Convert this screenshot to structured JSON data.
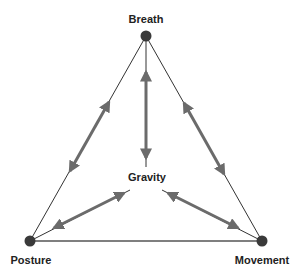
{
  "diagram": {
    "nodes": [
      {
        "id": "breath",
        "label": "Breath",
        "x": 146,
        "y": 36
      },
      {
        "id": "posture",
        "label": "Posture",
        "x": 30,
        "y": 241
      },
      {
        "id": "movement",
        "label": "Movement",
        "x": 262,
        "y": 241
      }
    ],
    "center": {
      "id": "gravity",
      "label": "Gravity",
      "x": 146,
      "y": 178
    },
    "edges": [
      {
        "from": "breath",
        "to": "posture",
        "type": "line"
      },
      {
        "from": "breath",
        "to": "movement",
        "type": "line"
      },
      {
        "from": "posture",
        "to": "movement",
        "type": "line"
      },
      {
        "from": "breath",
        "to": "gravity",
        "type": "double-arrow"
      },
      {
        "from": "posture",
        "to": "gravity",
        "type": "double-arrow"
      },
      {
        "from": "movement",
        "to": "gravity",
        "type": "double-arrow"
      },
      {
        "from": "breath",
        "to": "posture",
        "type": "double-arrow"
      },
      {
        "from": "breath",
        "to": "movement",
        "type": "double-arrow"
      }
    ],
    "colors": {
      "line": "#333333",
      "arrow": "#6b6b6b",
      "node": "#3a3a3a",
      "text": "#222222"
    }
  }
}
